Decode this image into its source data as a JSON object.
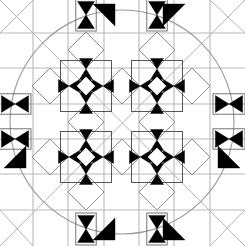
{
  "figure": {
    "background_color": "#ffffff",
    "width": 245,
    "height": 246
  },
  "colors": {
    "grid": "#b9b9b9",
    "diagonal": "#a9a9a9",
    "circle": "#9a9a9a",
    "diamond": "#8f8f8f",
    "motif_fill": "#000000",
    "motif_stroke": "#000000",
    "paper": "#ffffff"
  },
  "chart_data": {
    "type": "diagram",
    "grid": {
      "on": true,
      "spacing": 35.2,
      "origin_x": 33,
      "origin_y": 33,
      "columns": 6,
      "rows": 6,
      "vertical_x": [
        33,
        68,
        104,
        139,
        174,
        210
      ],
      "horizontal_y": [
        33,
        68,
        104,
        139,
        174,
        210
      ],
      "stroke_width": 1.1
    },
    "circle": {
      "center_x": 122,
      "center_y": 122,
      "radius": 112,
      "stroke_width": 1.1,
      "filled": false
    },
    "diamonds": [
      {
        "cx": 86,
        "cy": 50,
        "half": 18
      },
      {
        "cx": 157,
        "cy": 50,
        "half": 18
      },
      {
        "cx": 50,
        "cy": 86,
        "half": 18
      },
      {
        "cx": 122,
        "cy": 86,
        "half": 18
      },
      {
        "cx": 192,
        "cy": 86,
        "half": 18
      },
      {
        "cx": 86,
        "cy": 122,
        "half": 18
      },
      {
        "cx": 157,
        "cy": 122,
        "half": 18
      },
      {
        "cx": 50,
        "cy": 157,
        "half": 18
      },
      {
        "cx": 122,
        "cy": 157,
        "half": 18
      },
      {
        "cx": 192,
        "cy": 157,
        "half": 18
      },
      {
        "cx": 86,
        "cy": 192,
        "half": 18
      },
      {
        "cx": 157,
        "cy": 192,
        "half": 18
      }
    ],
    "star_motifs": [
      {
        "cx": 86,
        "cy": 86,
        "arm": 17,
        "label": "upper-left-star"
      },
      {
        "cx": 157,
        "cy": 86,
        "arm": 17,
        "label": "upper-right-star"
      },
      {
        "cx": 86,
        "cy": 157,
        "arm": 17,
        "label": "lower-left-star"
      },
      {
        "cx": 157,
        "cy": 157,
        "arm": 17,
        "label": "lower-right-star"
      }
    ],
    "edge_bowties": [
      {
        "cx": 15,
        "cy": 104,
        "orient": "h",
        "arm": 16,
        "label": "west-edge"
      },
      {
        "cx": 15,
        "cy": 139,
        "orient": "h",
        "arm": 16,
        "label": "west-edge-lower"
      },
      {
        "cx": 229,
        "cy": 104,
        "orient": "h",
        "arm": 16,
        "label": "east-edge"
      },
      {
        "cx": 229,
        "cy": 139,
        "orient": "h",
        "arm": 16,
        "label": "east-edge-lower"
      },
      {
        "cx": 86,
        "cy": 15,
        "orient": "v",
        "arm": 16,
        "label": "north-edge-left"
      },
      {
        "cx": 157,
        "cy": 15,
        "orient": "v",
        "arm": 16,
        "label": "north-edge-right"
      },
      {
        "cx": 86,
        "cy": 229,
        "orient": "v",
        "arm": 16,
        "label": "south-edge-left"
      },
      {
        "cx": 157,
        "cy": 229,
        "orient": "v",
        "arm": 16,
        "label": "south-edge-right"
      }
    ],
    "corner_triangles": [
      {
        "x": 104,
        "y": 15,
        "dir": "ne",
        "label": "north-left-corner"
      },
      {
        "x": 174,
        "y": 15,
        "dir": "nw",
        "label": "north-right-corner"
      },
      {
        "x": 15,
        "y": 157,
        "dir": "se",
        "label": "west-lower-corner"
      },
      {
        "x": 229,
        "y": 157,
        "dir": "sw",
        "label": "east-lower-corner"
      },
      {
        "x": 104,
        "y": 229,
        "dir": "se",
        "label": "south-left-corner"
      },
      {
        "x": 174,
        "y": 229,
        "dir": "sw",
        "label": "south-right-corner"
      }
    ],
    "diagonals": [
      {
        "x1": 0,
        "y1": 0,
        "x2": 245,
        "y2": 246
      },
      {
        "x1": 245,
        "y1": 0,
        "x2": 0,
        "y2": 246
      },
      {
        "x1": 33,
        "y1": 0,
        "x2": 0,
        "y2": 33
      },
      {
        "x1": 210,
        "y1": 0,
        "x2": 245,
        "y2": 33
      },
      {
        "x1": 0,
        "y1": 210,
        "x2": 33,
        "y2": 246
      },
      {
        "x1": 245,
        "y1": 210,
        "x2": 210,
        "y2": 246
      }
    ],
    "xlabel": "",
    "ylabel": "",
    "legend": []
  }
}
